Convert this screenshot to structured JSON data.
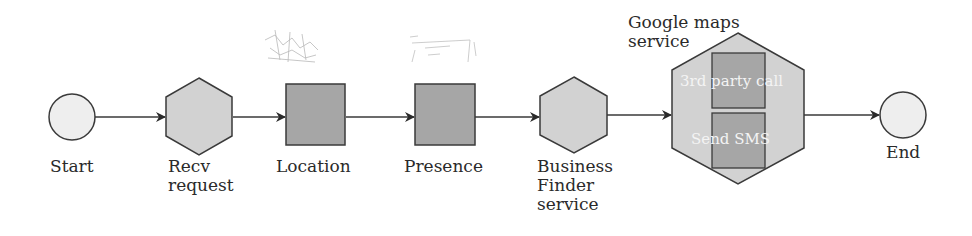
{
  "diagram": {
    "nodes": {
      "start": {
        "label": "Start",
        "shape": "circle"
      },
      "recv": {
        "line1": "Recv",
        "line2": "request",
        "shape": "hexagon"
      },
      "location": {
        "label": "Location",
        "shape": "square",
        "icon": "map-sketch-icon"
      },
      "presence": {
        "label": "Presence",
        "shape": "square",
        "icon": "presence-sketch-icon"
      },
      "business": {
        "line1": "Business",
        "line2": "Finder",
        "line3": "service",
        "shape": "hexagon"
      },
      "google": {
        "line1": "Google maps",
        "line2": "service",
        "shape": "hexagon",
        "inner": {
          "call": "3rd party call",
          "sms": "Send SMS"
        }
      },
      "end": {
        "label": "End",
        "shape": "circle"
      }
    },
    "edges": [
      [
        "Start",
        "Recv request"
      ],
      [
        "Recv request",
        "Location"
      ],
      [
        "Location",
        "Presence"
      ],
      [
        "Presence",
        "Business Finder service"
      ],
      [
        "Business Finder service",
        "Google maps service"
      ],
      [
        "Google maps service",
        "End"
      ]
    ],
    "colors": {
      "circle": "#eeeeee",
      "hexagon": "#d2d2d2",
      "square": "#a6a6a6",
      "stroke": "#3a3a3a"
    }
  }
}
